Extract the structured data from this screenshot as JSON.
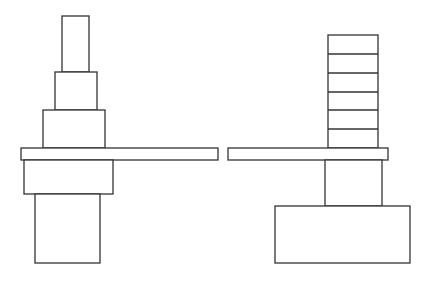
{
  "diagram": {
    "stroke_color": "#333333",
    "background": "#ffffff",
    "left_figure": {
      "name": "stepped-stack-on-plank",
      "shapes": [
        {
          "id": "top-block",
          "x": 62,
          "y": 16,
          "w": 27,
          "h": 56
        },
        {
          "id": "middle-block",
          "x": 55,
          "y": 72,
          "w": 42,
          "h": 38
        },
        {
          "id": "lower-block",
          "x": 43,
          "y": 110,
          "w": 62,
          "h": 38
        },
        {
          "id": "plank",
          "x": 21,
          "y": 148,
          "w": 197,
          "h": 12
        },
        {
          "id": "under-plank-block",
          "x": 24,
          "y": 160,
          "w": 89,
          "h": 34
        },
        {
          "id": "base-block",
          "x": 35,
          "y": 194,
          "w": 65,
          "h": 69
        }
      ]
    },
    "right_figure": {
      "name": "segmented-stack-on-plank",
      "shapes": [
        {
          "id": "segmented-stack",
          "x": 328,
          "y": 35,
          "w": 50,
          "h": 113,
          "divisions": [
            54,
            73,
            92,
            110,
            129
          ]
        },
        {
          "id": "plank",
          "x": 228,
          "y": 148,
          "w": 160,
          "h": 12
        },
        {
          "id": "column",
          "x": 325,
          "y": 160,
          "w": 57,
          "h": 46
        },
        {
          "id": "base-block",
          "x": 275,
          "y": 206,
          "w": 135,
          "h": 57
        }
      ]
    }
  }
}
